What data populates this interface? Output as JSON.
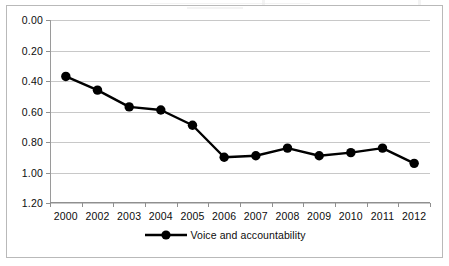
{
  "chart_data": {
    "type": "line",
    "title": "",
    "xlabel": "",
    "ylabel": "",
    "categories": [
      "2000",
      "2002",
      "2003",
      "2004",
      "2005",
      "2006",
      "2007",
      "2008",
      "2009",
      "2010",
      "2011",
      "2012"
    ],
    "series": [
      {
        "name": "Voice and accountability",
        "color": "#000000",
        "marker": "circle",
        "values": [
          0.37,
          0.46,
          0.57,
          0.59,
          0.69,
          0.9,
          0.89,
          0.84,
          0.89,
          0.87,
          0.84,
          0.94
        ]
      }
    ],
    "ylim": [
      0.0,
      1.2
    ],
    "y_inverted": true,
    "y_ticks": [
      "0.00",
      "0.20",
      "0.40",
      "0.60",
      "0.80",
      "1.00",
      "1.20"
    ],
    "y_tick_values": [
      0.0,
      0.2,
      0.4,
      0.6,
      0.8,
      1.0,
      1.2
    ],
    "grid": "horizontal",
    "legend_position": "bottom",
    "plot_background": "#ffffff",
    "gridline_color": "#c8c8c8",
    "axis_color": "#8f8f8f",
    "frame_color": "#b9b9b9"
  },
  "legend": {
    "entries": [
      {
        "label": "Voice and accountability"
      }
    ]
  }
}
